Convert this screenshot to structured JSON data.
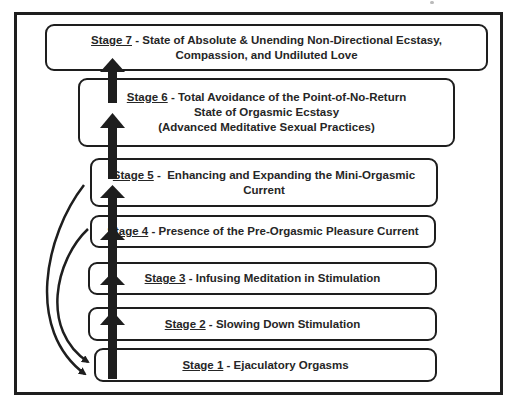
{
  "diagram": {
    "type": "staircase-flow",
    "direction": "bottom-to-top",
    "colors": {
      "border": "#1e1e1e",
      "text": "#262626",
      "background": "#ffffff",
      "arrow": "#1e1e1e"
    },
    "stages": [
      {
        "id": 1,
        "label": "Stage 1",
        "separator": " - ",
        "lines": [
          "Ejaculatory Orgasms"
        ]
      },
      {
        "id": 2,
        "label": "Stage 2",
        "separator": " - ",
        "lines": [
          "Slowing Down Stimulation"
        ]
      },
      {
        "id": 3,
        "label": "Stage 3",
        "separator": " - ",
        "lines": [
          "Infusing Meditation in Stimulation"
        ]
      },
      {
        "id": 4,
        "label": "Stage 4",
        "separator": " - ",
        "lines": [
          "Presence of the Pre-Orgasmic Pleasure Current"
        ]
      },
      {
        "id": 5,
        "label": "Stage 5",
        "separator": " -  ",
        "lines": [
          "Enhancing and Expanding the Mini-Orgasmic",
          "Current"
        ]
      },
      {
        "id": 6,
        "label": "Stage 6",
        "separator": " - ",
        "lines": [
          "Total Avoidance of the Point-of-No-Return",
          "State of Orgasmic Ecstasy",
          "(Advanced Meditative Sexual Practices)"
        ]
      },
      {
        "id": 7,
        "label": "Stage 7",
        "separator": " - ",
        "lines": [
          "State of Absolute & Unending Non-Directional Ecstasy,",
          "Compassion, and Undiluted Love"
        ]
      }
    ],
    "arrows": {
      "upward": [
        "Stage 1 -> Stage 2",
        "Stage 2 -> Stage 3",
        "Stage 3 -> Stage 4",
        "Stage 4 -> Stage 5",
        "Stage 5 -> Stage 6",
        "Stage 6 -> Stage 7"
      ],
      "return_curves": [
        "Stage 5 -> Stage 1",
        "Stage 4 -> Stage 1"
      ]
    }
  }
}
